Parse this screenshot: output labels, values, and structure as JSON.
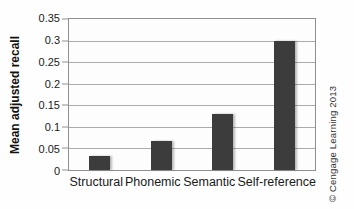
{
  "credit": "© Cengage Learning 2013",
  "chart_data": {
    "type": "bar",
    "title": "",
    "xlabel": "",
    "ylabel": "Mean adjusted recall",
    "categories": [
      "Structural",
      "Phonemic",
      "Semantic",
      "Self-reference"
    ],
    "values": [
      0.033,
      0.067,
      0.13,
      0.3
    ],
    "ylim": [
      0,
      0.35
    ],
    "ytick_step": 0.05,
    "ytick_labels": [
      "0.35",
      "0.3",
      "0.25",
      "0.2",
      "0.15",
      "0.1",
      "0.05",
      "0"
    ],
    "grid": true,
    "legend": null,
    "bar_color": "#3c3c3c",
    "grid_color": "#ababab",
    "axis_color": "#8f8f8f"
  }
}
